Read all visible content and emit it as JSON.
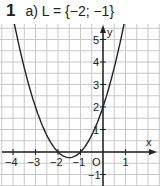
{
  "header": {
    "number": "1",
    "task": "a) L = {−2; −1}"
  },
  "chart_data": {
    "type": "line",
    "title": "a) L = {−2; −1}",
    "function": "y = (x+2)(x+1) = x^2 + 3x + 2",
    "xlabel": "x",
    "ylabel": "y",
    "xlim": [
      -4.5,
      2.5
    ],
    "ylim": [
      -1.5,
      5.8
    ],
    "grid": true,
    "grid_step": 0.5,
    "x_ticks": [
      "-4",
      "-3",
      "-2",
      "-1",
      "1"
    ],
    "y_ticks": [
      "-1",
      "1",
      "2",
      "3",
      "4",
      "5"
    ],
    "origin_label": "O",
    "roots": [
      -2,
      -1
    ],
    "vertex": [
      -1.5,
      -0.25
    ],
    "y_intercept": 2,
    "x": [
      -4.3,
      -4,
      -3.5,
      -3,
      -2.5,
      -2,
      -1.5,
      -1,
      -0.5,
      0,
      0.5,
      0.8
    ],
    "y": [
      5.59,
      6,
      4.25,
      2,
      0.75,
      0,
      -0.25,
      0,
      0.75,
      2,
      3.75,
      4.04
    ],
    "line_color": "#222222",
    "grid_color": "#c8c8c8"
  }
}
